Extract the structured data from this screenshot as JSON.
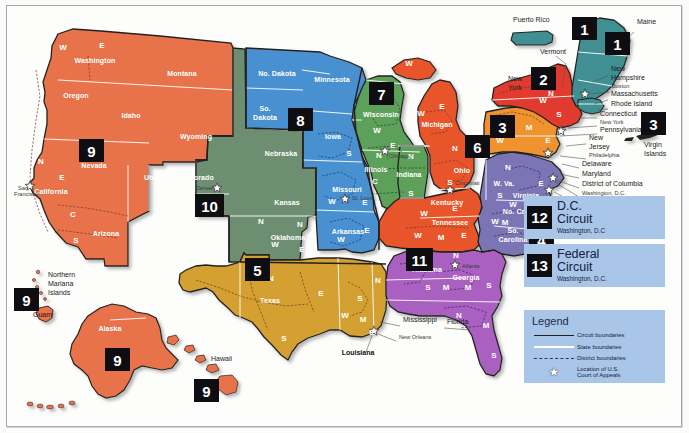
{
  "map": {
    "title": "Geographic Boundaries of United States Courts of Appeals and United States District Courts",
    "colors": {
      "circuit1": "#3f8f93",
      "circuit2": "#e03a2f",
      "circuit3": "#f0932f",
      "circuit4": "#7b74b5",
      "circuit5": "#d4a033",
      "circuit6": "#e8542c",
      "circuit7": "#5ba05a",
      "circuit8": "#4a90d0",
      "circuit9": "#e8724a",
      "circuit10": "#6e8e72",
      "circuit11": "#a961c0",
      "panel": "#a9c6e8",
      "badge": "#0d0d12",
      "frame": "#a9a9ad"
    }
  },
  "circuit_badges": [
    {
      "id": "pr-1",
      "label": "1",
      "x": 572,
      "y": 17,
      "w": 25,
      "h": 23
    },
    {
      "id": "ne-1",
      "label": "1",
      "x": 605,
      "y": 32,
      "w": 25,
      "h": 23
    },
    {
      "id": "ny-2",
      "label": "2",
      "x": 531,
      "y": 67,
      "w": 25,
      "h": 23
    },
    {
      "id": "pa-3",
      "label": "3",
      "x": 490,
      "y": 115,
      "w": 25,
      "h": 23
    },
    {
      "id": "vi-3",
      "label": "3",
      "x": 641,
      "y": 112,
      "w": 25,
      "h": 23
    },
    {
      "id": "mi-6",
      "label": "6",
      "x": 465,
      "y": 135,
      "w": 25,
      "h": 23
    },
    {
      "id": "wi-7",
      "label": "7",
      "x": 369,
      "y": 82,
      "w": 25,
      "h": 23
    },
    {
      "id": "sd-8",
      "label": "8",
      "x": 288,
      "y": 108,
      "w": 25,
      "h": 23
    },
    {
      "id": "nv-9",
      "label": "9",
      "x": 79,
      "y": 139,
      "w": 25,
      "h": 23
    },
    {
      "id": "co-10",
      "label": "10",
      "x": 195,
      "y": 194,
      "w": 29,
      "h": 23
    },
    {
      "id": "tx-5",
      "label": "5",
      "x": 245,
      "y": 258,
      "w": 25,
      "h": 23
    },
    {
      "id": "al-11",
      "label": "11",
      "x": 406,
      "y": 248,
      "w": 27,
      "h": 23
    },
    {
      "id": "sc-4",
      "label": "4",
      "x": 529,
      "y": 228,
      "w": 25,
      "h": 23
    },
    {
      "id": "nmi-9",
      "label": "9",
      "x": 14,
      "y": 288,
      "w": 25,
      "h": 23
    },
    {
      "id": "ak-9",
      "label": "9",
      "x": 105,
      "y": 348,
      "w": 25,
      "h": 23
    },
    {
      "id": "hi-9",
      "label": "9",
      "x": 194,
      "y": 379,
      "w": 25,
      "h": 23
    }
  ],
  "dc_circuit": {
    "number": "12",
    "name_line1": "D.C.",
    "name_line2": "Circuit",
    "location": "Washington, D.C"
  },
  "federal_circuit": {
    "number": "13",
    "name_line1": "Federal",
    "name_line2": "Circuit",
    "location": "Washington, D.C."
  },
  "legend": {
    "title": "Legend",
    "items": [
      {
        "key": "circuit-boundary-line",
        "label": "Circuit boundaries"
      },
      {
        "key": "state-boundary-line",
        "label": "State boundaries"
      },
      {
        "key": "district-boundary-line",
        "label": "District boundaries"
      },
      {
        "key": "court-star-icon",
        "label": "Location of U.S.",
        "label2": "Court of Appeals"
      }
    ]
  },
  "state_labels": [
    {
      "name": "Washington",
      "x": 95,
      "y": 63,
      "tone": "light"
    },
    {
      "name": "Oregon",
      "x": 76,
      "y": 98,
      "tone": "light"
    },
    {
      "name": "Idaho",
      "x": 131,
      "y": 118,
      "tone": "light"
    },
    {
      "name": "Montana",
      "x": 182,
      "y": 76,
      "tone": "light"
    },
    {
      "name": "Nevada",
      "x": 94,
      "y": 168,
      "tone": "light"
    },
    {
      "name": "California",
      "x": 51,
      "y": 194,
      "tone": "light"
    },
    {
      "name": "Arizona",
      "x": 106,
      "y": 236,
      "tone": "light"
    },
    {
      "name": "Utah",
      "x": 152,
      "y": 180,
      "tone": "light"
    },
    {
      "name": "Wyoming",
      "x": 196,
      "y": 139,
      "tone": "light"
    },
    {
      "name": "Colorado",
      "x": 198,
      "y": 180,
      "tone": "light"
    },
    {
      "name": "New",
      "x": 205,
      "y": 242,
      "tone": "light"
    },
    {
      "name": "Mexico",
      "x": 205,
      "y": 251,
      "tone": "light"
    },
    {
      "name": "No. Dakota",
      "x": 277,
      "y": 76,
      "tone": "light"
    },
    {
      "name": "So.",
      "x": 265,
      "y": 111,
      "tone": "light"
    },
    {
      "name": "Dakota",
      "x": 265,
      "y": 120,
      "tone": "light"
    },
    {
      "name": "Nebraska",
      "x": 281,
      "y": 156,
      "tone": "light"
    },
    {
      "name": "Kansas",
      "x": 287,
      "y": 205,
      "tone": "light"
    },
    {
      "name": "Oklahoma",
      "x": 288,
      "y": 240,
      "tone": "light"
    },
    {
      "name": "Minnesota",
      "x": 332,
      "y": 82,
      "tone": "light"
    },
    {
      "name": "Iowa",
      "x": 333,
      "y": 139,
      "tone": "light"
    },
    {
      "name": "Missouri",
      "x": 347,
      "y": 192,
      "tone": "light"
    },
    {
      "name": "Arkansas",
      "x": 348,
      "y": 234,
      "tone": "light"
    },
    {
      "name": "Wisconsin",
      "x": 381,
      "y": 117,
      "tone": "light"
    },
    {
      "name": "Illinois",
      "x": 376,
      "y": 172,
      "tone": "light"
    },
    {
      "name": "Indiana",
      "x": 409,
      "y": 177,
      "tone": "light"
    },
    {
      "name": "Michigan",
      "x": 437,
      "y": 127,
      "tone": "light"
    },
    {
      "name": "Ohio",
      "x": 462,
      "y": 173,
      "tone": "light"
    },
    {
      "name": "Kentucky",
      "x": 447,
      "y": 205,
      "tone": "light"
    },
    {
      "name": "Tennessee",
      "x": 450,
      "y": 225,
      "tone": "light"
    },
    {
      "name": "Texas",
      "x": 270,
      "y": 303,
      "tone": "light"
    },
    {
      "name": "Alabama",
      "x": 427,
      "y": 272,
      "tone": "light"
    },
    {
      "name": "Georgia",
      "x": 466,
      "y": 280,
      "tone": "light"
    },
    {
      "name": "W. Va.",
      "x": 504,
      "y": 186,
      "tone": "light"
    },
    {
      "name": "Virginia",
      "x": 526,
      "y": 198,
      "tone": "light"
    },
    {
      "name": "No. Carolina",
      "x": 524,
      "y": 214,
      "tone": "light"
    },
    {
      "name": "So.",
      "x": 513,
      "y": 233,
      "tone": "light"
    },
    {
      "name": "Carolina",
      "x": 513,
      "y": 242,
      "tone": "light"
    },
    {
      "name": "Alaska",
      "x": 110,
      "y": 331,
      "tone": "light"
    }
  ],
  "callout_labels": [
    {
      "name": "Puerto Rico",
      "x": 513,
      "y": 22,
      "size": "normal"
    },
    {
      "name": "Maine",
      "x": 637,
      "y": 24,
      "size": "normal"
    },
    {
      "name": "Vermont",
      "x": 540,
      "y": 54,
      "size": "normal"
    },
    {
      "name": "New",
      "x": 508,
      "y": 81,
      "size": "normal"
    },
    {
      "name": "York",
      "x": 508,
      "y": 90,
      "size": "normal"
    },
    {
      "name": "New",
      "x": 611,
      "y": 71,
      "size": "normal"
    },
    {
      "name": "Hampshire",
      "x": 611,
      "y": 80,
      "size": "normal"
    },
    {
      "name": "Boston",
      "x": 612,
      "y": 88,
      "size": "small"
    },
    {
      "name": "Massachusetts",
      "x": 611,
      "y": 96,
      "size": "normal"
    },
    {
      "name": "Rhode Island",
      "x": 611,
      "y": 106,
      "size": "normal"
    },
    {
      "name": "Connecticut",
      "x": 600,
      "y": 116,
      "size": "normal"
    },
    {
      "name": "New York",
      "x": 600,
      "y": 124,
      "size": "small"
    },
    {
      "name": "Pennsylvania",
      "x": 600,
      "y": 132,
      "size": "normal"
    },
    {
      "name": "New",
      "x": 589,
      "y": 140,
      "size": "normal"
    },
    {
      "name": "Jersey",
      "x": 589,
      "y": 149,
      "size": "normal"
    },
    {
      "name": "Philadelphia",
      "x": 589,
      "y": 157,
      "size": "small"
    },
    {
      "name": "Delaware",
      "x": 582,
      "y": 166,
      "size": "normal"
    },
    {
      "name": "Maryland",
      "x": 582,
      "y": 176,
      "size": "normal"
    },
    {
      "name": "District of Columbia",
      "x": 582,
      "y": 186,
      "size": "normal"
    },
    {
      "name": "Washington, D.C.",
      "x": 582,
      "y": 195,
      "size": "small"
    },
    {
      "name": "Richmond",
      "x": 582,
      "y": 203,
      "size": "small"
    },
    {
      "name": "Virgin",
      "x": 644,
      "y": 147,
      "size": "normal"
    },
    {
      "name": "Islands",
      "x": 644,
      "y": 156,
      "size": "normal"
    },
    {
      "name": "San",
      "x": 18,
      "y": 190,
      "size": "small"
    },
    {
      "name": "Francisco",
      "x": 14,
      "y": 196,
      "size": "small"
    },
    {
      "name": "Northern",
      "x": 48,
      "y": 277,
      "size": "normal"
    },
    {
      "name": "Mariana",
      "x": 48,
      "y": 286,
      "size": "normal"
    },
    {
      "name": "Islands",
      "x": 48,
      "y": 295,
      "size": "normal"
    },
    {
      "name": "Guam",
      "x": 33,
      "y": 317,
      "size": "normal"
    },
    {
      "name": "Hawaii",
      "x": 211,
      "y": 361,
      "size": "normal"
    },
    {
      "name": "Mississippi",
      "x": 403,
      "y": 322,
      "size": "normal"
    },
    {
      "name": "Florida",
      "x": 447,
      "y": 324,
      "size": "normal"
    },
    {
      "name": "New Orleans",
      "x": 399,
      "y": 339,
      "size": "small"
    },
    {
      "name": "Chicago",
      "x": 389,
      "y": 158,
      "size": "small"
    },
    {
      "name": "St. Louis",
      "x": 352,
      "y": 200,
      "size": "small"
    },
    {
      "name": "Cincinnati",
      "x": 455,
      "y": 185,
      "size": "small"
    },
    {
      "name": "Atlanta",
      "x": 462,
      "y": 268,
      "size": "small"
    },
    {
      "name": "Denver",
      "x": 196,
      "y": 190,
      "size": "small"
    }
  ],
  "emphasis_labels": [
    {
      "name": "Louisiana",
      "x": 358,
      "y": 355
    }
  ],
  "district_letters": [
    {
      "letter": "W",
      "x": 63,
      "y": 50,
      "tone": "light"
    },
    {
      "letter": "E",
      "x": 102,
      "y": 48,
      "tone": "light"
    },
    {
      "letter": "N",
      "x": 41,
      "y": 164,
      "tone": "light"
    },
    {
      "letter": "E",
      "x": 62,
      "y": 180,
      "tone": "light"
    },
    {
      "letter": "C",
      "x": 73,
      "y": 217,
      "tone": "light"
    },
    {
      "letter": "S",
      "x": 76,
      "y": 243,
      "tone": "light"
    },
    {
      "letter": "S",
      "x": 349,
      "y": 156,
      "tone": "light"
    },
    {
      "letter": "W",
      "x": 332,
      "y": 204,
      "tone": "light"
    },
    {
      "letter": "E",
      "x": 365,
      "y": 205,
      "tone": "light"
    },
    {
      "letter": "W",
      "x": 341,
      "y": 242,
      "tone": "light"
    },
    {
      "letter": "E",
      "x": 367,
      "y": 233,
      "tone": "light"
    },
    {
      "letter": "W",
      "x": 377,
      "y": 133,
      "tone": "light"
    },
    {
      "letter": "E",
      "x": 393,
      "y": 148,
      "tone": "light"
    },
    {
      "letter": "N",
      "x": 379,
      "y": 158,
      "tone": "light"
    },
    {
      "letter": "C",
      "x": 375,
      "y": 184,
      "tone": "light"
    },
    {
      "letter": "S",
      "x": 378,
      "y": 206,
      "tone": "light"
    },
    {
      "letter": "N",
      "x": 411,
      "y": 159,
      "tone": "light"
    },
    {
      "letter": "S",
      "x": 411,
      "y": 196,
      "tone": "light"
    },
    {
      "letter": "W",
      "x": 421,
      "y": 116,
      "tone": "light"
    },
    {
      "letter": "E",
      "x": 442,
      "y": 109,
      "tone": "light"
    },
    {
      "letter": "W",
      "x": 409,
      "y": 66,
      "tone": "light"
    },
    {
      "letter": "N",
      "x": 455,
      "y": 151,
      "tone": "light"
    },
    {
      "letter": "S",
      "x": 450,
      "y": 185,
      "tone": "light"
    },
    {
      "letter": "W",
      "x": 424,
      "y": 216,
      "tone": "light"
    },
    {
      "letter": "E",
      "x": 455,
      "y": 211,
      "tone": "light"
    },
    {
      "letter": "W",
      "x": 418,
      "y": 238,
      "tone": "light"
    },
    {
      "letter": "M",
      "x": 441,
      "y": 240,
      "tone": "light"
    },
    {
      "letter": "E",
      "x": 464,
      "y": 238,
      "tone": "light"
    },
    {
      "letter": "W",
      "x": 201,
      "y": 307,
      "tone": "light"
    },
    {
      "letter": "N",
      "x": 271,
      "y": 281,
      "tone": "light"
    },
    {
      "letter": "E",
      "x": 321,
      "y": 296,
      "tone": "light"
    },
    {
      "letter": "S",
      "x": 284,
      "y": 341,
      "tone": "light"
    },
    {
      "letter": "W",
      "x": 345,
      "y": 318,
      "tone": "light"
    },
    {
      "letter": "M",
      "x": 363,
      "y": 322,
      "tone": "light"
    },
    {
      "letter": "E",
      "x": 372,
      "y": 335,
      "tone": "light"
    },
    {
      "letter": "N",
      "x": 378,
      "y": 283,
      "tone": "light"
    },
    {
      "letter": "S",
      "x": 360,
      "y": 301,
      "tone": "light"
    },
    {
      "letter": "N",
      "x": 427,
      "y": 261,
      "tone": "light"
    },
    {
      "letter": "S",
      "x": 428,
      "y": 290,
      "tone": "light"
    },
    {
      "letter": "M",
      "x": 446,
      "y": 290,
      "tone": "light"
    },
    {
      "letter": "N",
      "x": 456,
      "y": 258,
      "tone": "light"
    },
    {
      "letter": "M",
      "x": 468,
      "y": 290,
      "tone": "light"
    },
    {
      "letter": "S",
      "x": 489,
      "y": 288,
      "tone": "light"
    },
    {
      "letter": "N",
      "x": 459,
      "y": 318,
      "tone": "light"
    },
    {
      "letter": "M",
      "x": 486,
      "y": 328,
      "tone": "light"
    },
    {
      "letter": "S",
      "x": 494,
      "y": 358,
      "tone": "light"
    },
    {
      "letter": "N",
      "x": 508,
      "y": 170,
      "tone": "light"
    },
    {
      "letter": "S",
      "x": 500,
      "y": 198,
      "tone": "light"
    },
    {
      "letter": "E",
      "x": 541,
      "y": 186,
      "tone": "light"
    },
    {
      "letter": "W",
      "x": 513,
      "y": 207,
      "tone": "light"
    },
    {
      "letter": "E",
      "x": 545,
      "y": 205,
      "tone": "light"
    },
    {
      "letter": "W",
      "x": 495,
      "y": 224,
      "tone": "light"
    },
    {
      "letter": "M",
      "x": 505,
      "y": 225,
      "tone": "light"
    },
    {
      "letter": "N",
      "x": 261,
      "y": 224,
      "tone": "light"
    },
    {
      "letter": "E",
      "x": 302,
      "y": 252,
      "tone": "light"
    },
    {
      "letter": "W",
      "x": 275,
      "y": 247,
      "tone": "light"
    },
    {
      "letter": "N",
      "x": 300,
      "y": 227,
      "tone": "light"
    },
    {
      "letter": "W",
      "x": 543,
      "y": 103,
      "tone": "light"
    },
    {
      "letter": "N",
      "x": 551,
      "y": 96,
      "tone": "light"
    },
    {
      "letter": "S",
      "x": 559,
      "y": 117,
      "tone": "light"
    },
    {
      "letter": "M",
      "x": 529,
      "y": 130,
      "tone": "light"
    },
    {
      "letter": "W",
      "x": 500,
      "y": 143,
      "tone": "light"
    },
    {
      "letter": "E",
      "x": 548,
      "y": 143,
      "tone": "light"
    }
  ],
  "appeals_stars": [
    {
      "city": "San Francisco",
      "x": 30,
      "y": 186
    },
    {
      "city": "Denver",
      "x": 217,
      "y": 188
    },
    {
      "city": "Chicago",
      "x": 385,
      "y": 151
    },
    {
      "city": "St. Louis",
      "x": 345,
      "y": 199
    },
    {
      "city": "New Orleans",
      "x": 374,
      "y": 331
    },
    {
      "city": "Atlanta",
      "x": 455,
      "y": 265
    },
    {
      "city": "Cincinnati",
      "x": 450,
      "y": 190
    },
    {
      "city": "Richmond",
      "x": 549,
      "y": 190
    },
    {
      "city": "Philadelphia",
      "x": 548,
      "y": 153
    },
    {
      "city": "New York",
      "x": 561,
      "y": 131
    },
    {
      "city": "Boston",
      "x": 585,
      "y": 94
    },
    {
      "city": "Washington DC",
      "x": 553,
      "y": 178
    }
  ]
}
